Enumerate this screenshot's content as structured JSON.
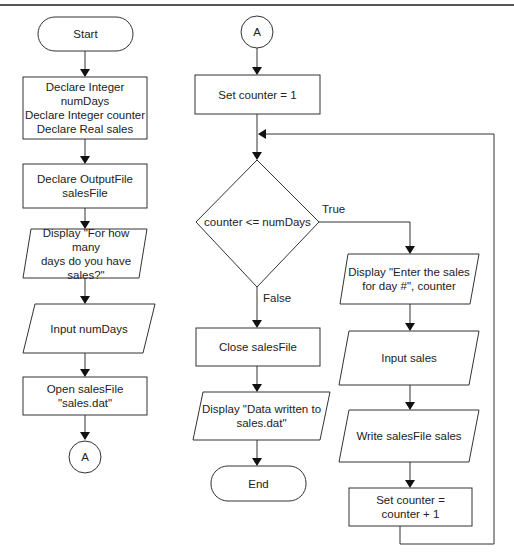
{
  "flowchart": {
    "left_column": {
      "start": "Start",
      "declare_vars": "Declare Integer numDays Declare Integer counter Declare Real sales",
      "declare_vars_lines": [
        "Declare Integer",
        "numDays",
        "Declare Integer counter",
        "Declare Real sales"
      ],
      "declare_file_lines": [
        "Declare OutputFile",
        "salesFile"
      ],
      "display_prompt_lines": [
        "Display \"For how many",
        "days do you have",
        "sales?\""
      ],
      "input_numdays": "Input numDays",
      "open_file_lines": [
        "Open salesFile",
        "\"sales.dat\""
      ],
      "connector": "A"
    },
    "middle_column": {
      "connector": "A",
      "set_counter": "Set counter = 1",
      "decision": "counter <= numDays",
      "true_label": "True",
      "false_label": "False",
      "close_file": "Close salesFile",
      "display_done_lines": [
        "Display \"Data written to",
        "sales.dat\""
      ],
      "end": "End"
    },
    "right_column": {
      "display_enter_lines": [
        "Display \"Enter the sales",
        "for day #\", counter"
      ],
      "input_sales": "Input sales",
      "write_sales": "Write salesFile sales",
      "increment_lines": [
        "Set counter =",
        "counter + 1"
      ]
    }
  }
}
